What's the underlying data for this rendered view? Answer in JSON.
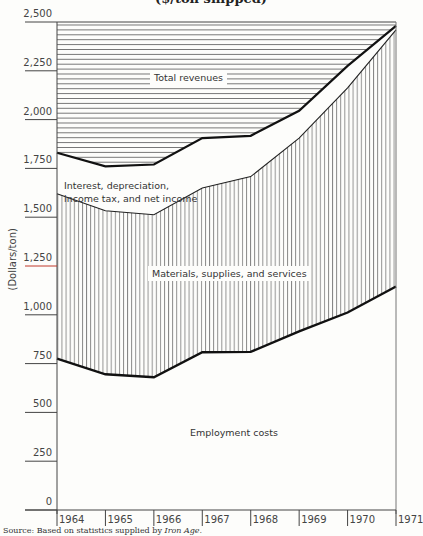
{
  "chart_data": {
    "type": "area",
    "title": "($/ton shipped)",
    "xlabel": "",
    "ylabel": "(Dollars/ton)",
    "ylim": [
      0,
      2500
    ],
    "x": [
      1964,
      1965,
      1966,
      1967,
      1968,
      1969,
      1970,
      1971
    ],
    "x_tick_labels": [
      "1964",
      "1965",
      "1966",
      "1967",
      "1968",
      "1969",
      "1970",
      "1971"
    ],
    "y_tick_labels": [
      "0",
      "250",
      "500",
      "750",
      "1,000",
      "1,250",
      "1,500",
      "1,750",
      "2,000",
      "2,250",
      "2,500"
    ],
    "stacked": true,
    "series": [
      {
        "name": "Employment costs",
        "values": [
          775,
          695,
          680,
          808,
          810,
          915,
          1012,
          1145
        ],
        "fill": "blank"
      },
      {
        "name": "Materials, supplies, and services",
        "cumulative_top": [
          1620,
          1533,
          1513,
          1650,
          1708,
          1905,
          2163,
          2460
        ],
        "values": [
          845,
          838,
          833,
          842,
          898,
          990,
          1151,
          1315
        ],
        "fill": "vertical-hatch"
      },
      {
        "name": "Interest, depreciation, income tax, and net income",
        "cumulative_top": [
          1830,
          1760,
          1770,
          1905,
          1917,
          2045,
          2275,
          2480
        ],
        "values": [
          210,
          227,
          257,
          255,
          209,
          140,
          112,
          20
        ],
        "fill": "blank"
      },
      {
        "name": "Total revenues",
        "values": [
          1830,
          1760,
          1770,
          1905,
          1917,
          2045,
          2275,
          2480
        ],
        "fill": "horizontal-hatch-above"
      }
    ],
    "grid": false,
    "legend": "inline area labels",
    "highlight": {
      "tick": "1,250",
      "color": "#c0392b"
    }
  },
  "title": "($/ton shipped)",
  "ylabel": "(Dollars/ton)",
  "labels": {
    "total_revenues": "Total revenues",
    "interest_line1": "Interest, depreciation,",
    "interest_line2": "income tax, and net income",
    "materials": "Materials, supplies, and services",
    "employment": "Employment costs"
  },
  "source_prefix": "Source: Based on statistics supplied by ",
  "source_italic": "Iron Age",
  "source_suffix": "."
}
